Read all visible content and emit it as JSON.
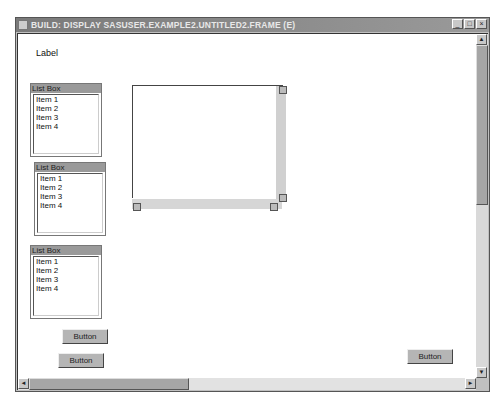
{
  "window": {
    "title": "BUILD: DISPLAY SASUSER.EXAMPLE2.UNTITLED2.FRAME (E)",
    "controls": {
      "minimize": "_",
      "maximize": "□",
      "close": "×"
    }
  },
  "frame": {
    "label": "Label",
    "listboxes": [
      {
        "title": "List Box",
        "items": [
          "Item 1",
          "Item 2",
          "Item 3",
          "Item 4"
        ]
      },
      {
        "title": "List Box",
        "items": [
          "Item 1",
          "Item 2",
          "Item 3",
          "Item 4"
        ]
      },
      {
        "title": "List Box",
        "items": [
          "Item 1",
          "Item 2",
          "Item 3",
          "Item 4"
        ]
      }
    ],
    "buttons": [
      "Button",
      "Button",
      "Button"
    ]
  },
  "icons": {
    "scroll_up": "▲",
    "scroll_down": "▼",
    "scroll_left": "◄",
    "scroll_right": "►"
  }
}
